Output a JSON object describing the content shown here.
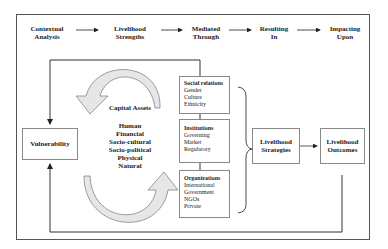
{
  "header_flow": [
    {
      "label_line1": "Contextual",
      "label_line2": "Analysis"
    },
    {
      "label_line1": "Livelihood",
      "label_line2": "Strengths"
    },
    {
      "label_line1": "Mediated",
      "label_line2": "Through"
    },
    {
      "label_line1": "Resulting",
      "label_line2": "In"
    },
    {
      "label_line1": "Impacting",
      "label_line2": "Upon"
    }
  ],
  "vulnerability": {
    "label": "Vulnerability"
  },
  "capital_assets": {
    "title": "Capital Assets",
    "items": [
      "Human",
      "Financial",
      "Socio-cultural",
      "Socio-political",
      "Physical",
      "Natural"
    ]
  },
  "mediating_boxes": [
    {
      "title": "Social relations",
      "items": [
        "Gender",
        "Culture",
        "Ethnicity"
      ]
    },
    {
      "title": "Institutions",
      "items": [
        "Governing",
        "Market",
        "Regulatory"
      ]
    },
    {
      "title": "Organizations",
      "items": [
        "International",
        "Government",
        "NGOs",
        "Private"
      ]
    }
  ],
  "strategies": {
    "line1": "Livelihood",
    "line2": "Strategies"
  },
  "outcomes": {
    "line1": "Livelihood",
    "line2": "Outcomes"
  },
  "colors": {
    "line": "#333333",
    "box_border": "#888888",
    "arrow_fill": "#e6e6e6"
  }
}
